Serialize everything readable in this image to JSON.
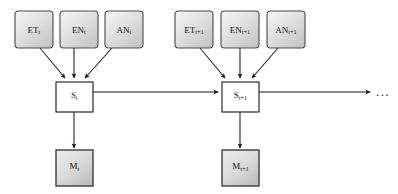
{
  "diagram": {
    "colors": {
      "observation_fill_light": "#f0f0f0",
      "observation_fill_dark": "#c6c6c6",
      "measurement_fill_light": "#e8e8e8",
      "measurement_fill_dark": "#c2c2c2",
      "state_fill": "#ffffff",
      "edge_color": "#1a1a1a",
      "border_color": "#4a4a4a",
      "background": "#ffffff"
    },
    "continuation": "...",
    "slices": [
      {
        "name": "slice-t",
        "observations": [
          {
            "id": "et-t",
            "base": "ET",
            "sub": "t",
            "label": "ET_t"
          },
          {
            "id": "en-t",
            "base": "EN",
            "sub": "t",
            "label": "EN_t"
          },
          {
            "id": "an-t",
            "base": "AN",
            "sub": "t",
            "label": "AN_t"
          }
        ],
        "state": {
          "id": "s-t",
          "base": "S",
          "sub": "t",
          "label": "S_t"
        },
        "measurement": {
          "id": "m-t",
          "base": "M",
          "sub": "t",
          "label": "M_t"
        }
      },
      {
        "name": "slice-t-plus-1",
        "observations": [
          {
            "id": "et-t1",
            "base": "ET",
            "sub": "t+1",
            "label": "ET_t+1"
          },
          {
            "id": "en-t1",
            "base": "EN",
            "sub": "t+1",
            "label": "EN_t+1"
          },
          {
            "id": "an-t1",
            "base": "AN",
            "sub": "t+1",
            "label": "AN_t+1"
          }
        ],
        "state": {
          "id": "s-t1",
          "base": "S",
          "sub": "t+1",
          "label": "S_t+1"
        },
        "measurement": {
          "id": "m-t1",
          "base": "M",
          "sub": "t+1",
          "label": "M_t+1"
        }
      }
    ],
    "edges": [
      {
        "id": "et-t-to-s-t",
        "from": "ET_t",
        "to": "S_t",
        "kind": "arrow"
      },
      {
        "id": "en-t-to-s-t",
        "from": "EN_t",
        "to": "S_t",
        "kind": "arrow"
      },
      {
        "id": "an-t-to-s-t",
        "from": "AN_t",
        "to": "S_t",
        "kind": "arrow"
      },
      {
        "id": "s-t-to-m-t",
        "from": "S_t",
        "to": "M_t",
        "kind": "arrow"
      },
      {
        "id": "s-t-to-s-t1",
        "from": "S_t",
        "to": "S_t+1",
        "kind": "arrow"
      },
      {
        "id": "et-t1-to-s-t1",
        "from": "ET_t+1",
        "to": "S_t+1",
        "kind": "arrow"
      },
      {
        "id": "en-t1-to-s-t1",
        "from": "EN_t+1",
        "to": "S_t+1",
        "kind": "arrow"
      },
      {
        "id": "an-t1-to-s-t1",
        "from": "AN_t+1",
        "to": "S_t+1",
        "kind": "arrow"
      },
      {
        "id": "s-t1-to-m-t1",
        "from": "S_t+1",
        "to": "M_t+1",
        "kind": "arrow"
      },
      {
        "id": "s-t1-to-next",
        "from": "S_t+1",
        "to": "...",
        "kind": "arrow"
      }
    ]
  }
}
